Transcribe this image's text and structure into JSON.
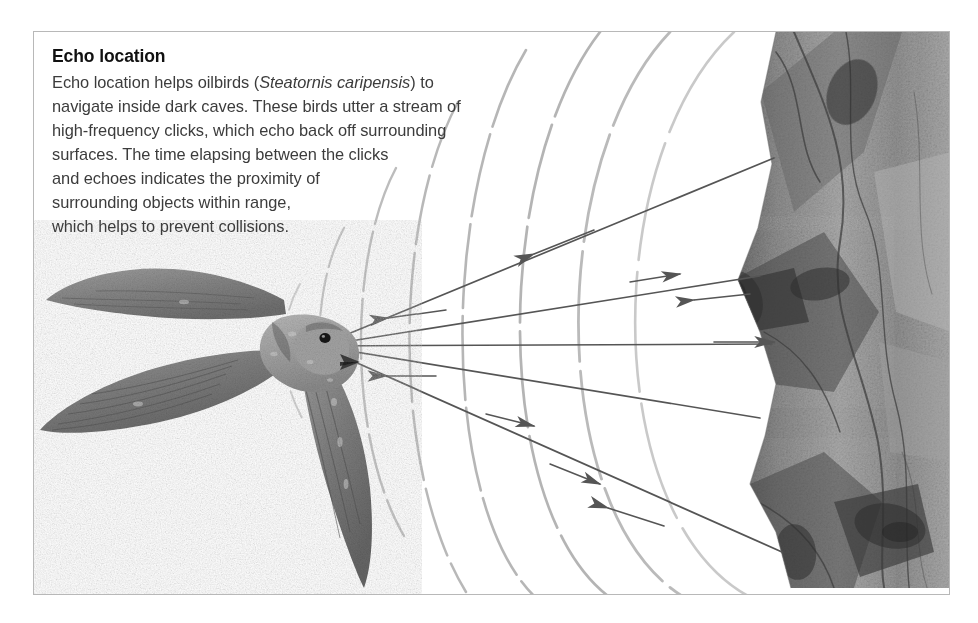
{
  "figure": {
    "domain": "diagram",
    "caption": {
      "title": "Echo location",
      "lines": [
        "Echo location helps oilbirds (",
        ") to",
        "navigate inside dark caves. These birds utter a stream of",
        "high-frequency clicks, which echo back off surrounding",
        "surfaces. The time elapsing between the clicks",
        "and echoes indicates the proximity of",
        "surrounding objects within range,",
        "which helps to prevent collisions."
      ],
      "species_name": "Steatornis caripensis",
      "line1_pre": "Echo location helps oilbirds (",
      "line1_post": ") to",
      "line2": "navigate inside dark caves. These birds utter a stream of",
      "line3": "high-frequency clicks, which echo back off surrounding",
      "line4": "surfaces. The time elapsing between the clicks",
      "line5": "and echoes indicates the proximity of",
      "line6": "surrounding objects within range,",
      "line7": "which helps to prevent collisions."
    },
    "colors": {
      "page_background": "#ffffff",
      "panel_background": "#ffffff",
      "panel_border": "#b8b8b8",
      "title_text": "#111111",
      "body_text": "#3c3c3c",
      "ray_line": "#5a5a5a",
      "wavefront_arc": "#9a9a9a",
      "rock_dark": "#4a4a4a",
      "rock_mid": "#8c8c8c",
      "rock_light": "#c6c6c6",
      "bird_dark": "#6e6e6e",
      "bird_mid": "#8f8f8f",
      "bird_light": "#b4b4b4",
      "bird_eye": "#1a1a1a"
    },
    "elements": {
      "bird_label": "oilbird in flight",
      "rock_label": "cave wall rock face",
      "wave_label": "high-frequency click wavefronts",
      "outgoing_ray_label": "outgoing click ray",
      "return_ray_label": "returning echo ray"
    },
    "geometry": {
      "panel": {
        "x": 33,
        "y": 31,
        "width": 917,
        "height": 564
      },
      "beak_origin": {
        "x": 285,
        "y": 314
      },
      "ray_count": 5,
      "wavefront_count": 7,
      "outgoing_arrow_count": 4,
      "echo_arrow_count": 5
    }
  }
}
